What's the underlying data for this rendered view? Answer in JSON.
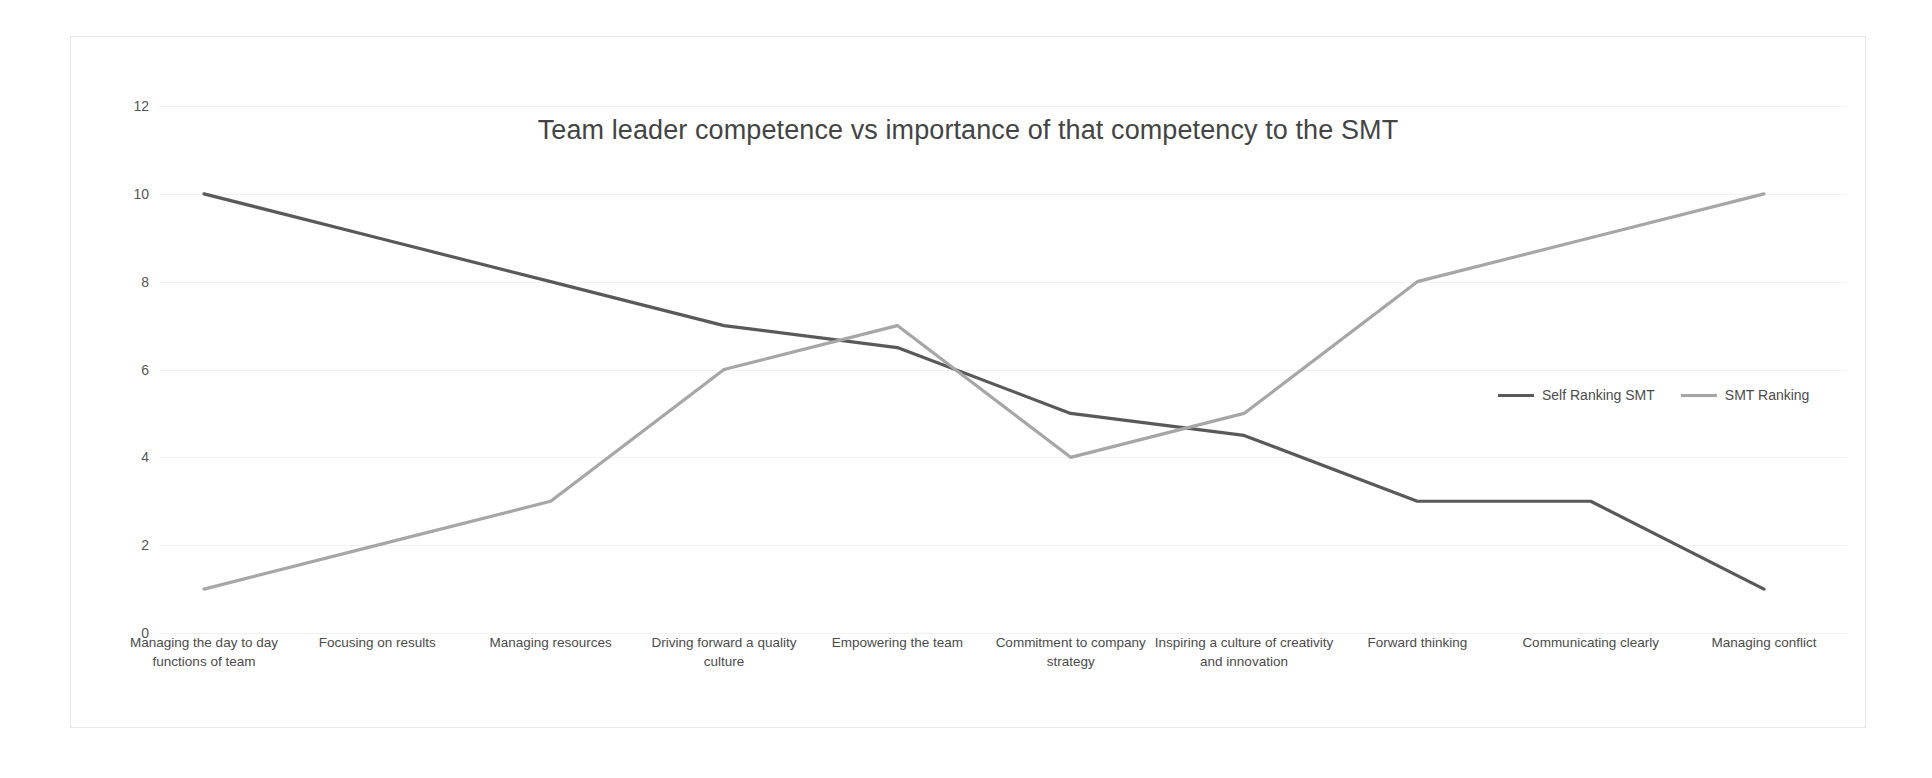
{
  "chart_data": {
    "type": "line",
    "title": "Team leader competence vs importance of that competency to the SMT",
    "xlabel": "",
    "ylabel": "",
    "ylim": [
      0,
      12
    ],
    "yticks": [
      0,
      2,
      4,
      6,
      8,
      10,
      12
    ],
    "grid": true,
    "legend_position": "right-inside",
    "categories": [
      "Managing the day to day functions of team",
      "Focusing on  results",
      "Managing resources",
      "Driving forward a quality culture",
      "Empowering the team",
      "Commitment to company strategy",
      "Inspiring a culture of creativity and innovation",
      "Forward thinking",
      "Communicating clearly",
      "Managing conflict"
    ],
    "series": [
      {
        "name": "Self Ranking SMT",
        "color": "#595959",
        "values": [
          10,
          9,
          8,
          7,
          6.5,
          5,
          4.5,
          3,
          3,
          1
        ]
      },
      {
        "name": "SMT Ranking",
        "color": "#a6a6a6",
        "values": [
          1,
          2,
          3,
          6,
          7,
          4,
          5,
          8,
          9,
          10
        ]
      }
    ]
  },
  "axis": {
    "y_tick_labels": [
      "12",
      "10",
      "8",
      "6",
      "4",
      "2",
      "0"
    ],
    "x_tick_labels": [
      "Managing the day to day functions of team",
      "Focusing on  results",
      "Managing resources",
      "Driving forward a quality culture",
      "Empowering the team",
      "Commitment to company strategy",
      "Inspiring a culture of creativity and innovation",
      "Forward thinking",
      "Communicating clearly",
      "Managing conflict"
    ]
  },
  "legend": {
    "entries": [
      {
        "label": "Self Ranking SMT",
        "color": "#595959"
      },
      {
        "label": "SMT Ranking",
        "color": "#a6a6a6"
      }
    ]
  },
  "colors": {
    "background": "#ffffff",
    "frame_border": "#e8e8e8",
    "gridline": "#f2f2f2",
    "text": "#4b4b4b",
    "title_text": "#444444",
    "series_dark": "#595959",
    "series_light": "#a6a6a6"
  }
}
